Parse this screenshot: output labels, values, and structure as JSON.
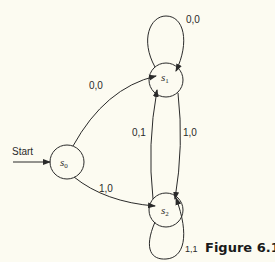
{
  "diagram": {
    "start_label": "Start",
    "figure_caption": "Figure 6.12",
    "states": [
      {
        "id": "s0",
        "name": "s",
        "sub": "0"
      },
      {
        "id": "s1",
        "name": "s",
        "sub": "1"
      },
      {
        "id": "s2",
        "name": "s",
        "sub": "2"
      }
    ],
    "transitions": [
      {
        "from": "s0",
        "to": "s1",
        "label": "0,0"
      },
      {
        "from": "s0",
        "to": "s2",
        "label": "1,0"
      },
      {
        "from": "s1",
        "to": "s1",
        "label": "0,0"
      },
      {
        "from": "s1",
        "to": "s2",
        "label": "1,0"
      },
      {
        "from": "s2",
        "to": "s1",
        "label": "0,1"
      },
      {
        "from": "s2",
        "to": "s2",
        "label": "1,1"
      }
    ],
    "colors": {
      "background": "#fcfbf1",
      "stroke": "#2a2a2a"
    }
  }
}
